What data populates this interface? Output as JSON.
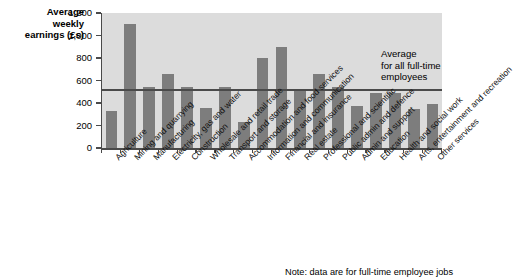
{
  "chart_data": {
    "type": "bar",
    "title": "",
    "xlabel": "",
    "ylabel": "Average weekly earnings (£s)",
    "ylabel_lines": [
      "Average",
      "weekly",
      "earnings (£s)"
    ],
    "ylim": [
      0,
      1200
    ],
    "ytick_values": [
      0,
      200,
      400,
      600,
      800,
      1000,
      1200
    ],
    "ytick_labels": [
      "0",
      "200",
      "400",
      "600",
      "800",
      "1,000",
      "1,200"
    ],
    "grid": false,
    "legend_position": "none",
    "plot_background": "#dcdcdc",
    "bar_color": "#7d7d7d",
    "axis_color": "#4a4a4a",
    "categories": [
      "Agriculture",
      "Mining and quarrying",
      "Manufacturing",
      "Electricity, gas and water",
      "Construction",
      "Wholesale and retail trade",
      "Transport and storage",
      "Accommodation and food services",
      "Information and communication",
      "Financial and insurance",
      "Real estate",
      "Professional and scientific",
      "Public admin and defence",
      "Admin and support",
      "Education",
      "Health and social work",
      "Arts, entertainment and recreation",
      "Other services"
    ],
    "values": [
      330,
      1100,
      540,
      660,
      540,
      360,
      540,
      230,
      800,
      900,
      510,
      660,
      540,
      370,
      490,
      490,
      350,
      390
    ],
    "reference_line": {
      "label_lines": [
        "Average",
        "for all full-time",
        "employees"
      ],
      "label": "Average for all full-time employees",
      "value": 515,
      "color": "#4a4a4a"
    },
    "note": "Note: data are for full-time employee jobs"
  }
}
